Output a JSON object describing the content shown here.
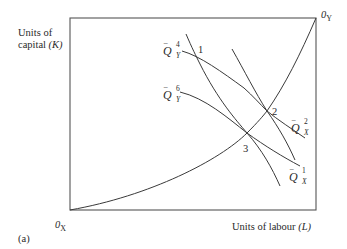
{
  "diagram": {
    "panel_label": "(a)",
    "y_axis_label": {
      "line1": "Units of",
      "line2_text": "capital ",
      "line2_symbol": "(K)"
    },
    "x_axis_label": {
      "text": "Units of labour ",
      "symbol": "(L)"
    },
    "origins": {
      "x_origin": {
        "base": "0",
        "sub": "X"
      },
      "y_origin": {
        "base": "0",
        "sub": "Y"
      }
    },
    "points": [
      "1",
      "2",
      "3"
    ],
    "isoquants": [
      {
        "name": "Q_Y_4",
        "symbol": "Q",
        "superscript": "4",
        "subscript": "Y"
      },
      {
        "name": "Q_Y_6",
        "symbol": "Q",
        "superscript": "6",
        "subscript": "Y"
      },
      {
        "name": "Q_X_2",
        "symbol": "Q",
        "superscript": "2",
        "subscript": "X"
      },
      {
        "name": "Q_X_1",
        "symbol": "Q",
        "superscript": "1",
        "subscript": "X"
      }
    ],
    "bar_glyph": "‾",
    "colors": {
      "line": "#3a3a3a",
      "box": "#555555",
      "text": "#2a2a2a"
    }
  }
}
